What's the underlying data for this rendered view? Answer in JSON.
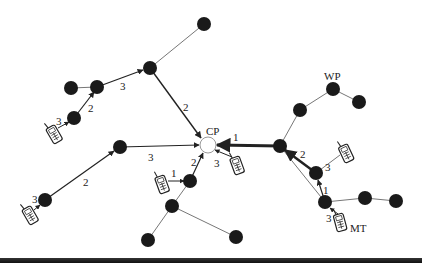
{
  "diagram": {
    "type": "ad-hoc network topology",
    "labels": {
      "cp": "CP",
      "wp": "WP",
      "mt": "MT"
    },
    "nodes": [
      {
        "id": "n1",
        "x": 204,
        "y": 24,
        "kind": "node"
      },
      {
        "id": "n2",
        "x": 150,
        "y": 68,
        "kind": "node"
      },
      {
        "id": "n3",
        "x": 97,
        "y": 87,
        "kind": "node"
      },
      {
        "id": "n4",
        "x": 71,
        "y": 88,
        "kind": "node"
      },
      {
        "id": "n5",
        "x": 74,
        "y": 118,
        "kind": "node"
      },
      {
        "id": "cp",
        "x": 208,
        "y": 145,
        "kind": "central-point"
      },
      {
        "id": "n6",
        "x": 120,
        "y": 147,
        "kind": "node"
      },
      {
        "id": "n7",
        "x": 45,
        "y": 200,
        "kind": "node"
      },
      {
        "id": "n8",
        "x": 190,
        "y": 181,
        "kind": "node"
      },
      {
        "id": "n9",
        "x": 172,
        "y": 206,
        "kind": "node"
      },
      {
        "id": "n10",
        "x": 148,
        "y": 240,
        "kind": "node"
      },
      {
        "id": "n11",
        "x": 236,
        "y": 237,
        "kind": "node"
      },
      {
        "id": "n12",
        "x": 280,
        "y": 146,
        "kind": "node"
      },
      {
        "id": "n13",
        "x": 300,
        "y": 110,
        "kind": "node"
      },
      {
        "id": "wp",
        "x": 333,
        "y": 89,
        "kind": "node"
      },
      {
        "id": "n14",
        "x": 359,
        "y": 102,
        "kind": "node"
      },
      {
        "id": "n15",
        "x": 316,
        "y": 173,
        "kind": "node"
      },
      {
        "id": "n16",
        "x": 325,
        "y": 202,
        "kind": "node"
      },
      {
        "id": "n17",
        "x": 365,
        "y": 198,
        "kind": "node"
      },
      {
        "id": "n18",
        "x": 396,
        "y": 201,
        "kind": "node"
      }
    ],
    "phones": [
      {
        "id": "pA",
        "x": 54,
        "y": 134,
        "angle": -30
      },
      {
        "id": "pB",
        "x": 30,
        "y": 215,
        "angle": -30
      },
      {
        "id": "pC",
        "x": 162,
        "y": 183,
        "angle": -20
      },
      {
        "id": "pD",
        "x": 237,
        "y": 164,
        "angle": -20
      },
      {
        "id": "pE",
        "x": 346,
        "y": 153,
        "angle": -25
      },
      {
        "id": "pMT",
        "x": 340,
        "y": 222,
        "angle": -15
      }
    ],
    "hop_labels": [
      {
        "text": "3",
        "x": 122,
        "y": 90
      },
      {
        "text": "2",
        "x": 89,
        "y": 110
      },
      {
        "text": "3",
        "x": 58,
        "y": 125
      },
      {
        "text": "2",
        "x": 184,
        "y": 110
      },
      {
        "text": "3",
        "x": 151,
        "y": 161
      },
      {
        "text": "2",
        "x": 85,
        "y": 185
      },
      {
        "text": "3",
        "x": 34,
        "y": 202
      },
      {
        "text": "1",
        "x": 173,
        "y": 177
      },
      {
        "text": "2",
        "x": 193,
        "y": 166
      },
      {
        "text": "3",
        "x": 217,
        "y": 166
      },
      {
        "text": "1",
        "x": 234,
        "y": 140
      },
      {
        "text": "2",
        "x": 302,
        "y": 157
      },
      {
        "text": "3",
        "x": 326,
        "y": 170
      },
      {
        "text": "1",
        "x": 324,
        "y": 194
      },
      {
        "text": "3",
        "x": 328,
        "y": 221
      }
    ]
  }
}
